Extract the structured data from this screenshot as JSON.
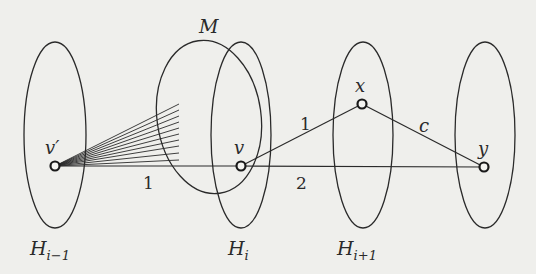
{
  "diagram": {
    "sets": [
      {
        "name": "H_{i-1}",
        "label_main": "H",
        "label_sub": "i−1"
      },
      {
        "name": "H_i",
        "label_main": "H",
        "label_sub": "i"
      },
      {
        "name": "H_{i+1}",
        "label_main": "H",
        "label_sub": "i+1"
      },
      {
        "name": "H_{i+2}",
        "label_main": "",
        "label_sub": ""
      }
    ],
    "matching_set": {
      "label": "M"
    },
    "vertices": [
      {
        "id": "v_prime",
        "label": "v′"
      },
      {
        "id": "v",
        "label": "v"
      },
      {
        "id": "x",
        "label": "x"
      },
      {
        "id": "y",
        "label": "y"
      }
    ],
    "edges": [
      {
        "from": "v_prime",
        "to": "v",
        "label": "1"
      },
      {
        "from": "v",
        "to": "x",
        "label": "1"
      },
      {
        "from": "x",
        "to": "y",
        "label": "c"
      },
      {
        "from": "v",
        "to": "y",
        "label": "2"
      }
    ],
    "fan": {
      "from": "v_prime",
      "into": "M",
      "line_count": 10
    },
    "colors": {
      "stroke": "#2a2a2a",
      "background": "#efefec"
    }
  }
}
